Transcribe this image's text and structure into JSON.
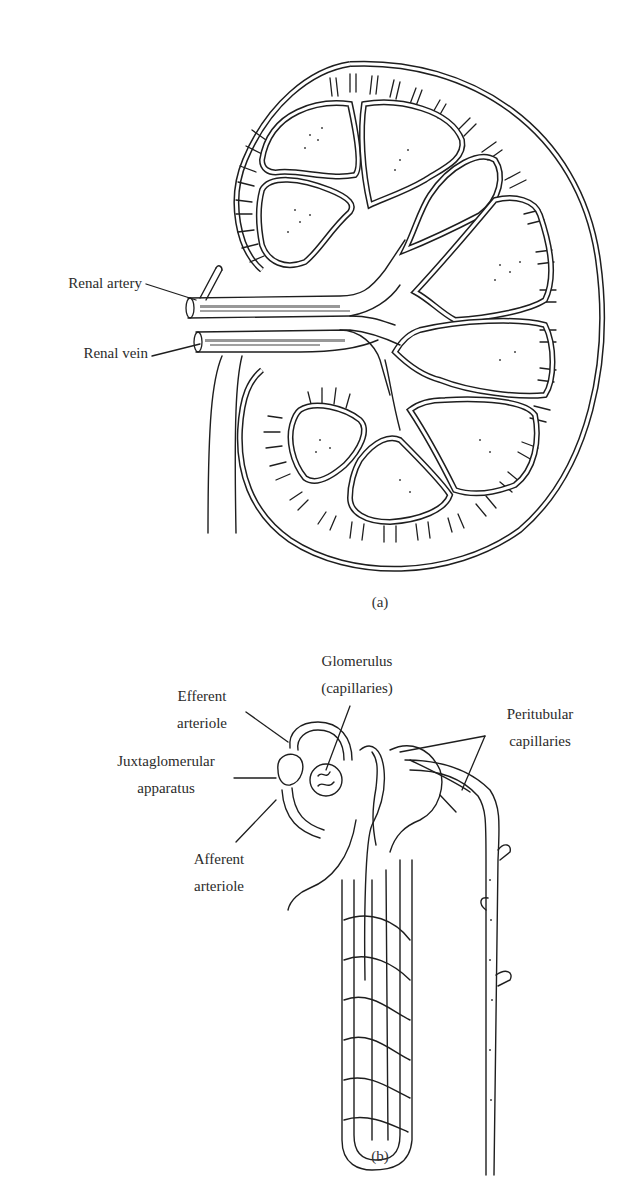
{
  "figure": {
    "panel_a": {
      "caption": "(a)",
      "subject": "kidney-cross-section",
      "labels": {
        "renal_artery": "Renal artery",
        "renal_vein": "Renal vein"
      }
    },
    "panel_b": {
      "caption": "(b)",
      "subject": "nephron-blood-supply",
      "labels": {
        "glomerulus_line1": "Glomerulus",
        "glomerulus_line2": "(capillaries)",
        "efferent_line1": "Efferent",
        "efferent_line2": "arteriole",
        "juxta_line1": "Juxtaglomerular",
        "juxta_line2": "apparatus",
        "afferent_line1": "Afferent",
        "afferent_line2": "arteriole",
        "peritubular_line1": "Peritubular",
        "peritubular_line2": "capillaries"
      }
    }
  },
  "colors": {
    "ink": "#1e1e1e",
    "text": "#2b2b2b",
    "background": "#ffffff"
  }
}
